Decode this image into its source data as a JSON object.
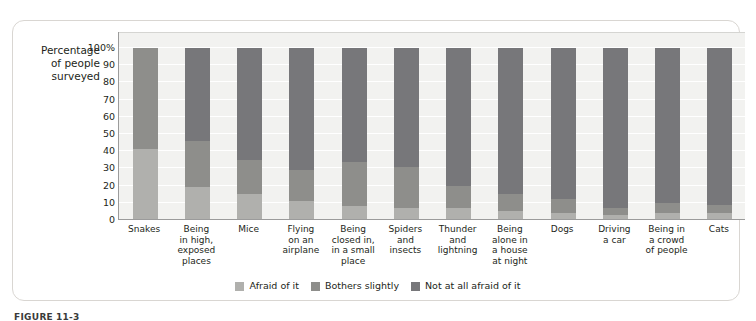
{
  "figure": {
    "caption_prefix": "FIGURE",
    "caption_number": "11-3"
  },
  "chart_data": {
    "type": "bar",
    "subtype": "100% stacked column",
    "title": "",
    "xlabel": "",
    "ylabel": "Percentage of people surveyed",
    "ylabel_lines": [
      "Percentage",
      "of people",
      "surveyed"
    ],
    "ylim": [
      0,
      100
    ],
    "yticks": [
      0,
      10,
      20,
      30,
      40,
      50,
      60,
      70,
      80,
      90,
      100
    ],
    "ytick_labels": [
      "0",
      "10",
      "20",
      "30",
      "40",
      "50",
      "60",
      "70",
      "80",
      "90",
      "100%"
    ],
    "grid": true,
    "legend_position": "bottom",
    "categories": [
      "Snakes",
      "Being in high, exposed places",
      "Mice",
      "Flying on an airplane",
      "Being closed in, in a small place",
      "Spiders and insects",
      "Thunder and lightning",
      "Being alone in a house at night",
      "Dogs",
      "Driving a car",
      "Being in a crowd of people",
      "Cats"
    ],
    "category_lines": [
      [
        "Snakes"
      ],
      [
        "Being",
        "in high,",
        "exposed",
        "places"
      ],
      [
        "Mice"
      ],
      [
        "Flying",
        "on an",
        "airplane"
      ],
      [
        "Being",
        "closed in,",
        "in a small",
        "place"
      ],
      [
        "Spiders",
        "and",
        "insects"
      ],
      [
        "Thunder",
        "and",
        "lightning"
      ],
      [
        "Being",
        "alone in",
        "a house",
        "at night"
      ],
      [
        "Dogs"
      ],
      [
        "Driving",
        "a car"
      ],
      [
        "Being in",
        "a crowd",
        "of people"
      ],
      [
        "Cats"
      ]
    ],
    "series": [
      {
        "name": "Afraid of it",
        "color": "#b0b0ad",
        "values": [
          41,
          19,
          15,
          11,
          8,
          7,
          7,
          5,
          4,
          3,
          4,
          4
        ]
      },
      {
        "name": "Bothers slightly",
        "color": "#8e8e8b",
        "values": [
          59,
          27,
          20,
          18,
          26,
          24,
          13,
          10,
          8,
          4,
          6,
          5
        ]
      },
      {
        "name": "Not at all afraid of it",
        "color": "#77777a",
        "values": [
          0,
          54,
          65,
          71,
          66,
          69,
          80,
          85,
          88,
          93,
          90,
          91
        ]
      }
    ],
    "cumulative_tops": [
      [
        41,
        100,
        100
      ],
      [
        19,
        46,
        100
      ],
      [
        15,
        35,
        100
      ],
      [
        11,
        29,
        100
      ],
      [
        8,
        34,
        100
      ],
      [
        7,
        31,
        100
      ],
      [
        7,
        20,
        100
      ],
      [
        5,
        15,
        100
      ],
      [
        4,
        12,
        100
      ],
      [
        3,
        7,
        100
      ],
      [
        4,
        10,
        100
      ],
      [
        4,
        9,
        100
      ]
    ]
  },
  "colors": {
    "plot_background": "#f2f2f0",
    "gridline": "#ffffff",
    "axis": "#9b9b9b",
    "frame": "#d9d6d2",
    "text": "#231f20"
  }
}
